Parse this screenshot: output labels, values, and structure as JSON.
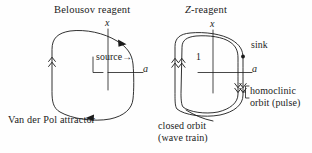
{
  "figure": {
    "background_color": "#fefefe",
    "ink_color": "#1b1b1b",
    "width": 312,
    "height": 153
  },
  "left_panel": {
    "title": "Belousov reagent",
    "axis_vertical_label": "x",
    "axis_horizontal_label": "a",
    "source_label": "source",
    "source_arrow_glyph": "→",
    "caption": "Van der Pol attractor"
  },
  "right_panel": {
    "title_italic_prefix": "Z",
    "title_rest": "-reagent",
    "title_full": "Z-reagent",
    "axis_vertical_label": "x",
    "axis_horizontal_label": "a",
    "level_label": "1",
    "sink_label": "sink",
    "homoclinic_label_line1": "homoclinic",
    "homoclinic_label_line2": "orbit (pulse)",
    "closed_orbit_label_line1": "closed orbit",
    "closed_orbit_label_line2": "(wave train)"
  }
}
